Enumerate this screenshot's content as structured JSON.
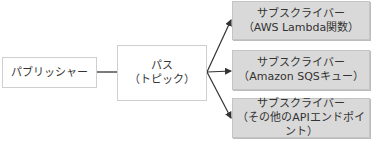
{
  "diagram": {
    "publisher": {
      "label": "パブリッシャー"
    },
    "topic": {
      "line1": "パス",
      "line2": "（トピック）"
    },
    "subscribers": [
      {
        "line1": "サブスクライバー",
        "line2": "（AWS Lambda関数）"
      },
      {
        "line1": "サブスクライバー",
        "line2": "（Amazon SQSキュー）"
      },
      {
        "line1": "サブスクライバー",
        "line2": "（その他のAPIエンドポイント）"
      }
    ],
    "colors": {
      "subscriber_fill": "#d9d9d9",
      "line": "#333333",
      "border": "#cfcfcf"
    }
  }
}
